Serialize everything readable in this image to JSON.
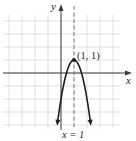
{
  "chart_data": {
    "type": "line",
    "title": "",
    "xlabel": "x",
    "ylabel": "y",
    "xlim": [
      -4.5,
      5.3
    ],
    "ylim": [
      -4.3,
      5.2
    ],
    "grid": true,
    "grid_step": 1,
    "series": [
      {
        "name": "parabola",
        "equation": "y = -3(x - 1)^2 + 1",
        "x": [
          -0.25,
          0,
          0.25,
          0.5,
          0.75,
          1,
          1.25,
          1.5,
          1.75,
          2,
          2.25
        ],
        "y": [
          -3.69,
          -2,
          -0.69,
          0.25,
          0.81,
          1,
          0.81,
          0.25,
          -0.69,
          -2,
          -3.69
        ],
        "arrows": "both ends"
      }
    ],
    "annotations": [
      {
        "type": "point",
        "x": 1,
        "y": 1,
        "label": "(1, 1)"
      },
      {
        "type": "vline",
        "x": 1,
        "style": "dashed",
        "label": "x = 1"
      }
    ]
  },
  "labels": {
    "y_axis": "y",
    "x_axis": "x",
    "vertex": "(1, 1)",
    "axis_of_symmetry": "x = 1"
  },
  "colors": {
    "grid": "#d9d9d9",
    "axis": "#3a3a3a",
    "curve": "#1e1e1e",
    "dashed": "#7a7a7a"
  }
}
